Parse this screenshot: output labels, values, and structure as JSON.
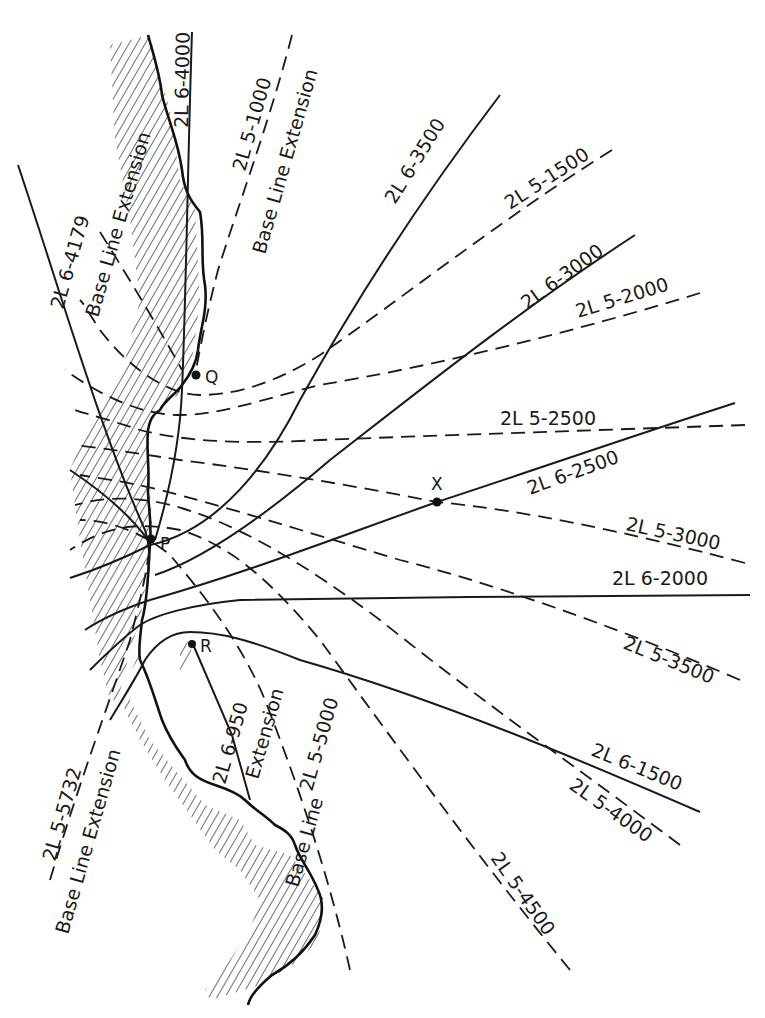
{
  "diagram": {
    "type": "loran-hyperbolic-lattice",
    "points": [
      {
        "id": "Q",
        "label": "Q"
      },
      {
        "id": "P",
        "label": "P"
      },
      {
        "id": "R",
        "label": "R"
      },
      {
        "id": "X",
        "label": "X"
      }
    ],
    "solid_lines_6": [
      {
        "label": "2L 6-4000"
      },
      {
        "label": "2L 6-3500"
      },
      {
        "label": "2L 6-3000"
      },
      {
        "label": "2L 6-2500"
      },
      {
        "label": "2L 6-2000"
      },
      {
        "label": "2L 6-1500"
      },
      {
        "label": "2L 6-950"
      },
      {
        "label": "2L 6-4179"
      }
    ],
    "dashed_lines_5": [
      {
        "label": "2L 5-1000"
      },
      {
        "label": "2L 5-1500"
      },
      {
        "label": "2L 5-2000"
      },
      {
        "label": "2L 5-2500"
      },
      {
        "label": "2L 5-3000"
      },
      {
        "label": "2L 5-3500"
      },
      {
        "label": "2L 5-4000"
      },
      {
        "label": "2L 5-4500"
      },
      {
        "label": "2L 5-5000"
      },
      {
        "label": "2L 5-5732"
      }
    ],
    "baseline_labels": {
      "base_line_extension": "Base Line Extension",
      "base_line": "Base Line",
      "extension": "Extension"
    }
  }
}
